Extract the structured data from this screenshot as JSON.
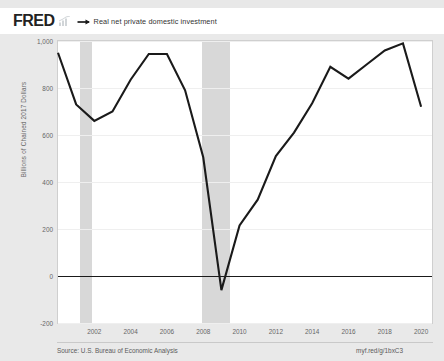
{
  "header": {
    "logo_text": "FRED",
    "logo_icon": "fred-bar-chart-icon",
    "legend_marker_icon": "line-marker-icon",
    "legend_label": "Real net private domestic investment"
  },
  "footer": {
    "source": "Source: U.S. Bureau of Economic Analysis",
    "permalink": "myf.red/g/1bxC3"
  },
  "chart_data": {
    "type": "line",
    "title": "Real net private domestic investment",
    "xlabel": "",
    "ylabel": "Billions of Chained 2017 Dollars",
    "xlim": [
      2000,
      2020.6
    ],
    "ylim": [
      -200,
      1000
    ],
    "grid": true,
    "legend_position": "top",
    "zero_line": 0,
    "ytick_labels": [
      "1,000",
      "800",
      "600",
      "400",
      "200",
      "0",
      "-200"
    ],
    "ytick_values": [
      1000,
      800,
      600,
      400,
      200,
      0,
      -200
    ],
    "xtick_labels": [
      "2002",
      "2004",
      "2006",
      "2008",
      "2010",
      "2012",
      "2014",
      "2016",
      "2018",
      "2020"
    ],
    "xtick_values": [
      2002,
      2004,
      2006,
      2008,
      2010,
      2012,
      2014,
      2016,
      2018,
      2020
    ],
    "recession_bands": [
      {
        "start": 2001.2,
        "end": 2001.9
      },
      {
        "start": 2007.95,
        "end": 2009.5
      }
    ],
    "series": [
      {
        "name": "Real net private domestic investment",
        "color": "#1a1a1a",
        "x": [
          2000,
          2001,
          2002,
          2003,
          2004,
          2005,
          2006,
          2007,
          2008,
          2009,
          2010,
          2011,
          2012,
          2013,
          2014,
          2015,
          2016,
          2017,
          2018,
          2019,
          2020
        ],
        "values": [
          950,
          730,
          660,
          700,
          835,
          945,
          945,
          790,
          505,
          -60,
          215,
          325,
          510,
          610,
          735,
          890,
          840,
          900,
          960,
          990,
          720
        ]
      }
    ]
  }
}
